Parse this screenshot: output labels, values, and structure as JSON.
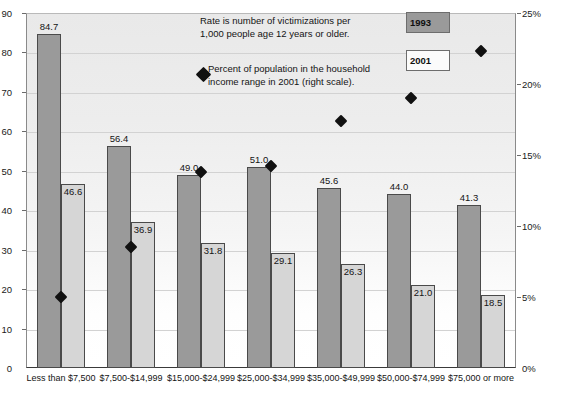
{
  "axes": {
    "left_ticks": [
      "90",
      "80",
      "70",
      "60",
      "50",
      "40",
      "30",
      "20",
      "10",
      "0"
    ],
    "right_ticks": [
      "25%",
      "20%",
      "15%",
      "10%",
      "5%",
      "0%"
    ]
  },
  "legend": {
    "note_rate_line1": "Rate is number of victimizations per",
    "note_rate_line2": "1,000 people age 12 years or older.",
    "note_pct_line1": "Percent of population in the household",
    "note_pct_line2": "income range in 2001 (right scale).",
    "swatch_1993": "1993",
    "swatch_2001": "2001"
  },
  "chart_data": {
    "type": "bar",
    "title": "",
    "xlabel": "",
    "ylabel": "",
    "ylim": [
      0,
      90
    ],
    "y2lim": [
      0,
      25
    ],
    "grid": true,
    "legend_position": "top-right",
    "categories": [
      "Less than $7,500",
      "$7,500-$14,999",
      "$15,000-$24,999",
      "$25,000-$34,999",
      "$35,000-$49,999",
      "$50,000-$74,999",
      "$75,000 or more"
    ],
    "series": [
      {
        "name": "1993",
        "type": "bar",
        "axis": "left",
        "values": [
          84.7,
          56.4,
          49.0,
          51.0,
          45.6,
          44.0,
          41.3
        ],
        "labels": [
          "84.7",
          "56.4",
          "49.0",
          "51.0",
          "45.6",
          "44.0",
          "41.3"
        ]
      },
      {
        "name": "2001",
        "type": "bar",
        "axis": "left",
        "values": [
          46.6,
          36.9,
          31.8,
          29.1,
          26.3,
          21.0,
          18.5
        ],
        "labels": [
          "46.6",
          "36.9",
          "31.8",
          "29.1",
          "26.3",
          "21.0",
          "18.5"
        ]
      },
      {
        "name": "Percent of population in the household income range in 2001",
        "type": "scatter",
        "axis": "right",
        "values": [
          5.0,
          8.5,
          13.8,
          14.2,
          17.4,
          19.0,
          22.3
        ]
      }
    ]
  }
}
